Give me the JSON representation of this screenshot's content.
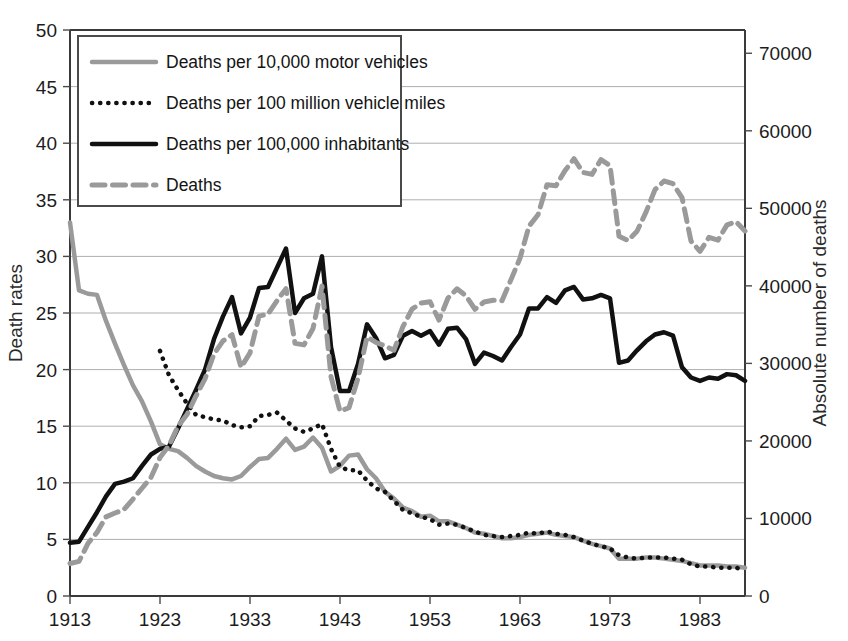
{
  "chart_data": {
    "type": "line",
    "title": "",
    "xlabel": "",
    "ylabel": "Death rates",
    "y2label": "Absolute number of deaths",
    "xlim": [
      1913,
      1988
    ],
    "ylim": [
      0,
      50
    ],
    "y2lim": [
      0,
      73000
    ],
    "grid": true,
    "legend_position": "top-left",
    "xticks": [
      1913,
      1923,
      1933,
      1943,
      1953,
      1963,
      1973,
      1983
    ],
    "yticks": [
      0,
      5,
      10,
      15,
      20,
      25,
      30,
      35,
      40,
      45,
      50
    ],
    "y2ticks": [
      0,
      10000,
      20000,
      30000,
      40000,
      50000,
      60000,
      70000
    ],
    "x": [
      1913,
      1914,
      1915,
      1916,
      1917,
      1918,
      1919,
      1920,
      1921,
      1922,
      1923,
      1924,
      1925,
      1926,
      1927,
      1928,
      1929,
      1930,
      1931,
      1932,
      1933,
      1934,
      1935,
      1936,
      1937,
      1938,
      1939,
      1940,
      1941,
      1942,
      1943,
      1944,
      1945,
      1946,
      1947,
      1948,
      1949,
      1950,
      1951,
      1952,
      1953,
      1954,
      1955,
      1956,
      1957,
      1958,
      1959,
      1960,
      1961,
      1962,
      1963,
      1964,
      1965,
      1966,
      1967,
      1968,
      1969,
      1970,
      1971,
      1972,
      1973,
      1974,
      1975,
      1976,
      1977,
      1978,
      1979,
      1980,
      1981,
      1982,
      1983,
      1984,
      1985,
      1986,
      1987,
      1988
    ],
    "series": [
      {
        "name": "Deaths per 10,000 motor vehicles",
        "axis": "left",
        "style": "solid",
        "color": "#9a9a9a",
        "width": 4.5,
        "values": [
          33.0,
          27.0,
          26.7,
          26.6,
          24.3,
          22.3,
          20.4,
          18.6,
          17.2,
          15.4,
          13.4,
          13.0,
          12.8,
          12.2,
          11.5,
          11.0,
          10.6,
          10.4,
          10.3,
          10.6,
          11.4,
          12.1,
          12.2,
          13.0,
          13.9,
          12.9,
          13.2,
          14.0,
          13.1,
          11.0,
          11.5,
          12.4,
          12.5,
          11.2,
          10.4,
          9.2,
          8.6,
          7.8,
          7.5,
          7.0,
          7.1,
          6.6,
          6.6,
          6.3,
          6.0,
          5.6,
          5.5,
          5.3,
          5.1,
          5.1,
          5.2,
          5.4,
          5.5,
          5.6,
          5.4,
          5.3,
          5.2,
          4.9,
          4.6,
          4.4,
          4.2,
          3.3,
          3.3,
          3.3,
          3.4,
          3.4,
          3.3,
          3.2,
          3.1,
          2.9,
          2.7,
          2.7,
          2.7,
          2.6,
          2.6,
          2.5
        ]
      },
      {
        "name": "Deaths per 100 million vehicle miles",
        "axis": "left",
        "style": "dotted",
        "color": "#111111",
        "width": 4.5,
        "values": [
          null,
          null,
          null,
          null,
          null,
          null,
          null,
          null,
          null,
          null,
          21.65,
          19.5,
          18.2,
          17.0,
          16.0,
          15.8,
          15.6,
          15.5,
          15.1,
          14.9,
          15.0,
          15.9,
          16.0,
          16.2,
          15.5,
          14.8,
          14.5,
          14.8,
          15.2,
          13.0,
          11.4,
          11.1,
          11.1,
          10.2,
          9.5,
          9.2,
          8.4,
          7.6,
          7.3,
          7.0,
          6.8,
          6.3,
          6.4,
          6.3,
          6.0,
          5.7,
          5.4,
          5.3,
          5.2,
          5.3,
          5.4,
          5.6,
          5.5,
          5.7,
          5.5,
          5.4,
          5.2,
          4.9,
          4.6,
          4.4,
          4.2,
          3.6,
          3.4,
          3.3,
          3.4,
          3.4,
          3.4,
          3.3,
          3.2,
          2.8,
          2.6,
          2.6,
          2.5,
          2.5,
          2.5,
          2.3
        ]
      },
      {
        "name": "Deaths per 100,000 inhabitants",
        "axis": "left",
        "style": "solid",
        "color": "#111111",
        "width": 4.5,
        "values": [
          4.7,
          4.8,
          6.1,
          7.4,
          8.8,
          9.9,
          10.1,
          10.4,
          11.5,
          12.5,
          13.0,
          13.2,
          14.8,
          16.5,
          18.2,
          20.0,
          22.7,
          24.7,
          26.4,
          23.2,
          24.6,
          27.2,
          27.3,
          29.0,
          30.7,
          25.0,
          26.3,
          26.7,
          30.0,
          22.0,
          18.1,
          18.1,
          20.5,
          24.0,
          22.8,
          21.0,
          21.3,
          23.0,
          23.4,
          23.0,
          23.4,
          22.2,
          23.6,
          23.7,
          22.7,
          20.5,
          21.5,
          21.2,
          20.8,
          22.0,
          23.1,
          25.4,
          25.4,
          26.4,
          25.9,
          27.0,
          27.3,
          26.2,
          26.3,
          26.6,
          26.3,
          20.6,
          20.8,
          21.7,
          22.5,
          23.1,
          23.3,
          23.0,
          20.2,
          19.3,
          19.0,
          19.3,
          19.2,
          19.6,
          19.5,
          19.0
        ]
      },
      {
        "name": "Deaths",
        "axis": "right",
        "style": "dashed",
        "color": "#9a9a9a",
        "width": 5.0,
        "values": [
          4200,
          4468,
          6779,
          8200,
          10200,
          10700,
          11150,
          12500,
          13900,
          15300,
          17870,
          19400,
          21900,
          23400,
          25800,
          28000,
          31215,
          32900,
          33700,
          29500,
          31363,
          36101,
          36369,
          38089,
          39643,
          32582,
          32386,
          34501,
          39969,
          28309,
          23823,
          24282,
          28076,
          33411,
          32697,
          32259,
          31701,
          34763,
          36996,
          37794,
          37955,
          35586,
          38426,
          39628,
          38702,
          36981,
          37910,
          38137,
          38091,
          40804,
          43564,
          47700,
          49163,
          53041,
          52924,
          54862,
          56400,
          54633,
          54381,
          56278,
          55511,
          46402,
          45853,
          47038,
          49510,
          52411,
          53524,
          53172,
          51385,
          45779,
          44452,
          46263,
          45901,
          47865,
          48290,
          47087
        ]
      }
    ]
  },
  "legend": {
    "items": [
      {
        "label": "Deaths per 10,000 motor vehicles",
        "style": "solid",
        "color": "#9a9a9a"
      },
      {
        "label": "Deaths per 100 million vehicle miles",
        "style": "dotted",
        "color": "#111111"
      },
      {
        "label": "Deaths per 100,000 inhabitants",
        "style": "solid",
        "color": "#111111"
      },
      {
        "label": "Deaths",
        "style": "dashed",
        "color": "#9a9a9a"
      }
    ]
  }
}
